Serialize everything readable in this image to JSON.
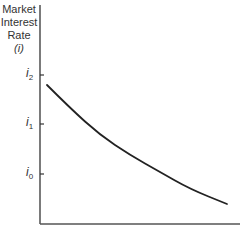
{
  "chart_data": {
    "type": "line",
    "title": "",
    "xlabel": "",
    "ylabel": "Market Interest Rate (i)",
    "ylabel_lines": [
      "Market",
      "Interest",
      "Rate",
      "(i)"
    ],
    "y_ticks": [
      {
        "label": "i",
        "sub": "2",
        "y": 75
      },
      {
        "label": "i",
        "sub": "1",
        "y": 124
      },
      {
        "label": "i",
        "sub": "0",
        "y": 174
      }
    ],
    "series": [
      {
        "name": "curve",
        "description": "downward-sloping convex curve",
        "points": [
          [
            47,
            85
          ],
          [
            70,
            108
          ],
          [
            100,
            135
          ],
          [
            130,
            155
          ],
          [
            160,
            172
          ],
          [
            190,
            189
          ],
          [
            227,
            204
          ]
        ]
      }
    ],
    "grid": false,
    "legend": null
  }
}
